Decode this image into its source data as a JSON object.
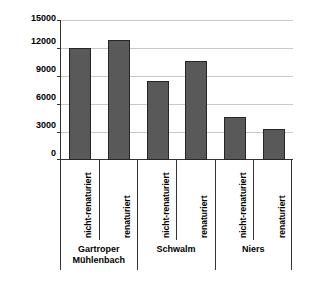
{
  "chart_data": {
    "type": "bar",
    "title": "",
    "xlabel": "",
    "ylabel": "Individuen/ha",
    "ylim": [
      0,
      15000
    ],
    "ytick_labels": [
      "15000",
      "12000",
      "9000",
      "6000",
      "3000",
      "0"
    ],
    "yticks": [
      15000,
      12000,
      9000,
      6000,
      3000,
      0
    ],
    "grid": true,
    "legend": "none",
    "groups": [
      {
        "name": "Gartroper Mühlenbach",
        "name_lines": [
          "Gartroper",
          "Mühlenbach"
        ]
      },
      {
        "name": "Schwalm",
        "name_lines": [
          "Schwalm"
        ]
      },
      {
        "name": "Niers",
        "name_lines": [
          "Niers"
        ]
      }
    ],
    "categories": [
      "nicht-renaturiert",
      "renaturiert",
      "nicht-renaturiert",
      "renaturiert",
      "nicht-renaturiert",
      "renaturiert"
    ],
    "values": [
      12100,
      12900,
      8500,
      10700,
      4600,
      3400
    ],
    "bar_color": "#595959",
    "bar_edge_color": "#262626",
    "gridline_color": "#c8c8c8",
    "axis_color": "#333333"
  }
}
